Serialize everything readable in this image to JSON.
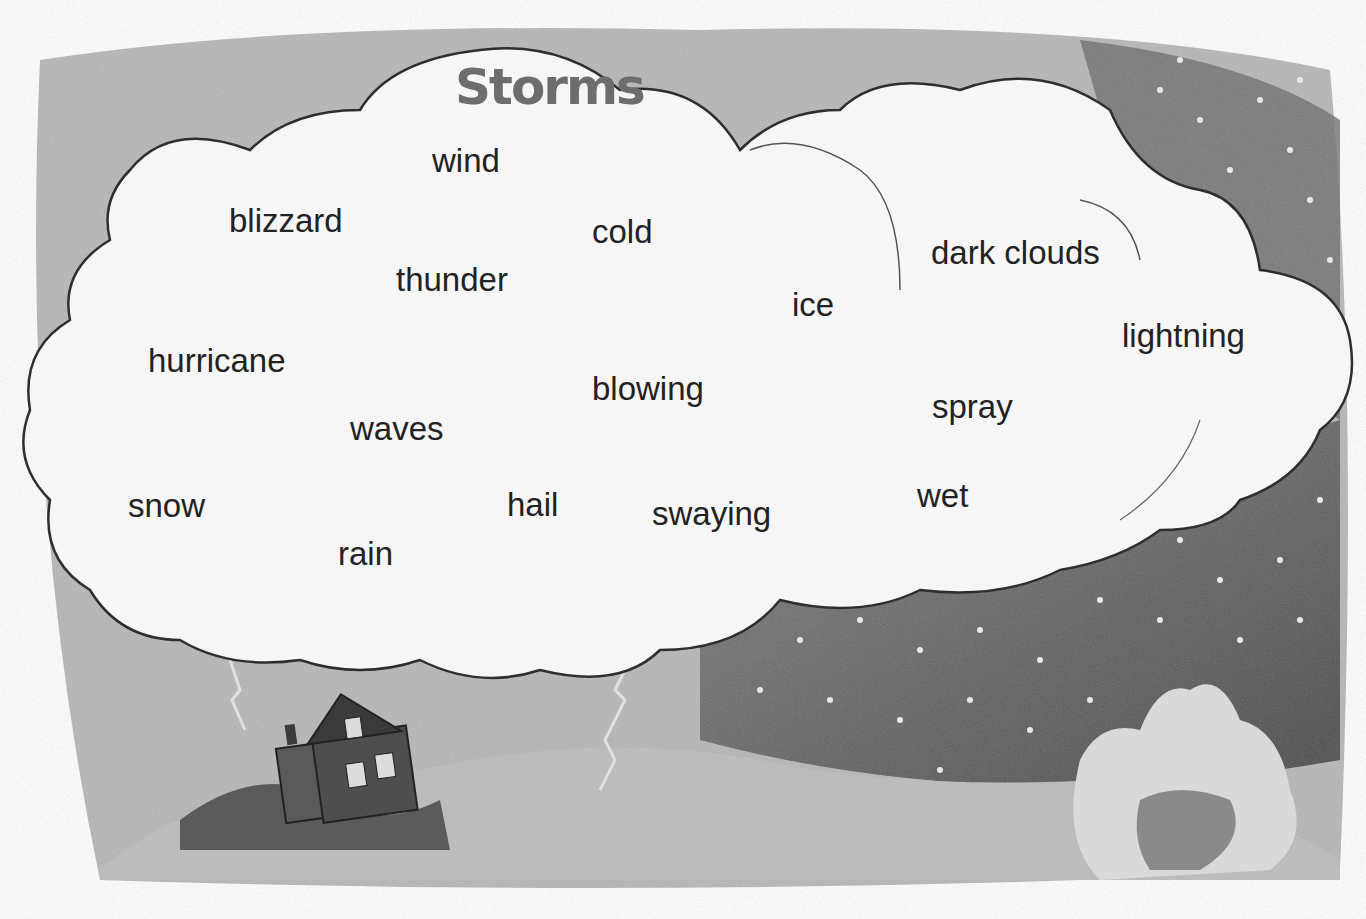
{
  "title": "Storms",
  "words": [
    {
      "text": "wind",
      "x": 432,
      "y": 142
    },
    {
      "text": "blizzard",
      "x": 229,
      "y": 202
    },
    {
      "text": "cold",
      "x": 592,
      "y": 213
    },
    {
      "text": "thunder",
      "x": 396,
      "y": 261
    },
    {
      "text": "dark clouds",
      "x": 931,
      "y": 234
    },
    {
      "text": "ice",
      "x": 792,
      "y": 286
    },
    {
      "text": "lightning",
      "x": 1122,
      "y": 317
    },
    {
      "text": "hurricane",
      "x": 148,
      "y": 342
    },
    {
      "text": "blowing",
      "x": 592,
      "y": 370
    },
    {
      "text": "spray",
      "x": 932,
      "y": 388
    },
    {
      "text": "waves",
      "x": 350,
      "y": 410
    },
    {
      "text": "snow",
      "x": 128,
      "y": 487
    },
    {
      "text": "hail",
      "x": 507,
      "y": 486
    },
    {
      "text": "swaying",
      "x": 652,
      "y": 495
    },
    {
      "text": "wet",
      "x": 917,
      "y": 477
    },
    {
      "text": "rain",
      "x": 338,
      "y": 535
    }
  ],
  "colors": {
    "title": "#6d6d6d",
    "word": "#222222",
    "cloud": "#f4f4f4",
    "sky_dark": "#5a5a5a",
    "sky_mid": "#9a9a9a",
    "ground": "#b5b5b5"
  },
  "illustration": {
    "elements": [
      "storm-cloud",
      "lightning-bolt",
      "house",
      "tree",
      "rain-drops",
      "hills"
    ]
  }
}
